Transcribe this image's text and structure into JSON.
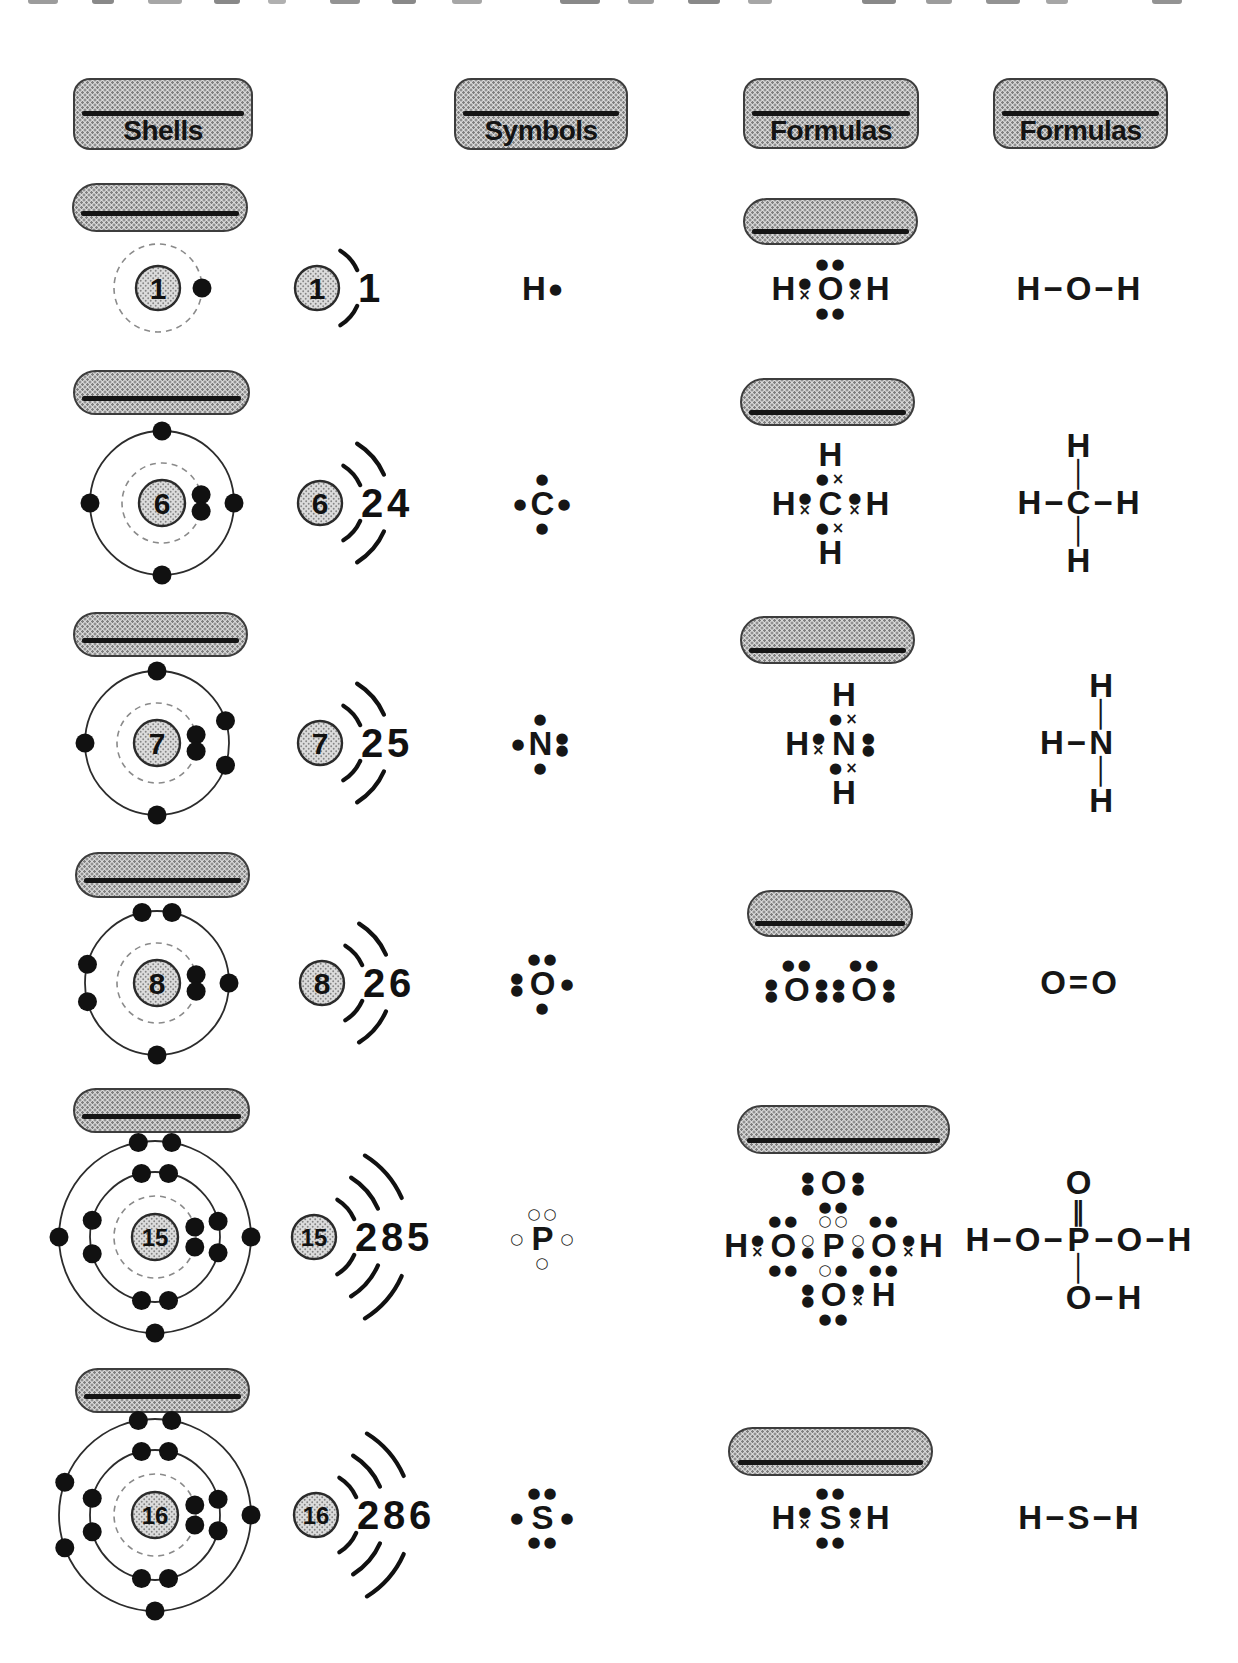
{
  "headers": [
    "Shells",
    "Symbols",
    "Formulas",
    "Formulas"
  ],
  "rows": [
    {
      "element": "hydrogen",
      "compound": "water",
      "nucleus": "1",
      "shell_counts": [
        "1"
      ],
      "bohr_shells": [
        {
          "dashed": true,
          "electrons": [
            0
          ]
        }
      ],
      "symbol": [
        [
          "H",
          "●"
        ]
      ],
      "lewis": [
        [
          "",
          "",
          "h:●●",
          "",
          ""
        ],
        [
          "H",
          "v:●×",
          "O",
          "v:●×",
          "H"
        ],
        [
          "",
          "",
          "h:●●",
          "",
          ""
        ]
      ],
      "structural": [
        [
          "H",
          "−",
          "O",
          "−",
          "H"
        ]
      ]
    },
    {
      "element": "carbon",
      "compound": "methane",
      "nucleus": "6",
      "shell_counts": [
        "2",
        "4"
      ],
      "bohr_shells": [
        {
          "dashed": true,
          "electrons": [
            12,
            -12
          ]
        },
        {
          "dashed": false,
          "electrons": [
            90,
            180,
            270,
            0
          ]
        }
      ],
      "symbol": [
        [
          "",
          "●",
          ""
        ],
        [
          "●",
          "C",
          "●"
        ],
        [
          "",
          "●",
          ""
        ]
      ],
      "lewis": [
        [
          "",
          "",
          "H",
          "",
          ""
        ],
        [
          "",
          "",
          "h:●×",
          "",
          ""
        ],
        [
          "H",
          "v:●×",
          "C",
          "v:●×",
          "H"
        ],
        [
          "",
          "",
          "h:●×",
          "",
          ""
        ],
        [
          "",
          "",
          "H",
          "",
          ""
        ]
      ],
      "structural": [
        [
          "",
          "",
          "H",
          "",
          ""
        ],
        [
          "",
          "",
          "│",
          "",
          ""
        ],
        [
          "H",
          "−",
          "C",
          "−",
          "H"
        ],
        [
          "",
          "",
          "│",
          "",
          ""
        ],
        [
          "",
          "",
          "H",
          "",
          ""
        ]
      ]
    },
    {
      "element": "nitrogen",
      "compound": "ammonia",
      "nucleus": "7",
      "shell_counts": [
        "2",
        "5"
      ],
      "bohr_shells": [
        {
          "dashed": true,
          "electrons": [
            12,
            -12
          ]
        },
        {
          "dashed": false,
          "electrons": [
            90,
            180,
            270,
            18,
            -18
          ]
        }
      ],
      "symbol": [
        [
          "",
          "●",
          ""
        ],
        [
          "●",
          "N",
          "v:●●"
        ],
        [
          "",
          "●",
          ""
        ]
      ],
      "lewis": [
        [
          "",
          "",
          "H",
          ""
        ],
        [
          "",
          "",
          "h:●×",
          ""
        ],
        [
          "H",
          "v:●×",
          "N",
          "v:●●"
        ],
        [
          "",
          "",
          "h:●×",
          ""
        ],
        [
          "",
          "",
          "H",
          ""
        ]
      ],
      "structural": [
        [
          "",
          "",
          "H",
          ""
        ],
        [
          "",
          "",
          "│",
          ""
        ],
        [
          "H",
          "−",
          "N",
          ""
        ],
        [
          "",
          "",
          "│",
          ""
        ],
        [
          "",
          "",
          "H",
          ""
        ]
      ]
    },
    {
      "element": "oxygen",
      "compound": "oxygen-molecule",
      "nucleus": "8",
      "shell_counts": [
        "2",
        "6"
      ],
      "bohr_shells": [
        {
          "dashed": true,
          "electrons": [
            12,
            -12
          ]
        },
        {
          "dashed": false,
          "electrons": [
            102,
            78,
            165,
            195,
            0,
            270
          ]
        }
      ],
      "symbol": [
        [
          "",
          "h:●●",
          ""
        ],
        [
          "v:●●",
          "O",
          "●"
        ],
        [
          "",
          "●",
          ""
        ]
      ],
      "lewis": [
        [
          "",
          "h:●●",
          "",
          "",
          "h:●●",
          ""
        ],
        [
          "v:●●",
          "O",
          "v:●●",
          "v:●●",
          "O",
          "v:●●"
        ]
      ],
      "structural": [
        [
          "O",
          "=",
          "O"
        ]
      ]
    },
    {
      "element": "phosphorus",
      "compound": "phosphoric-acid",
      "nucleus": "15",
      "shell_counts": [
        "2",
        "8",
        "5"
      ],
      "bohr_shells": [
        {
          "dashed": true,
          "electrons": [
            14,
            -14
          ]
        },
        {
          "dashed": false,
          "electrons": [
            102,
            78,
            165,
            195,
            258,
            282,
            14,
            -14
          ]
        },
        {
          "dashed": false,
          "electrons": [
            100,
            80,
            180,
            0,
            270
          ]
        }
      ],
      "symbol": [
        [
          "",
          "h:○○",
          ""
        ],
        [
          "○",
          "P",
          "○"
        ],
        [
          "",
          "○",
          ""
        ]
      ],
      "lewis": [
        [
          "",
          "",
          "",
          "v:●●",
          "O",
          "v:●●",
          "",
          "",
          ""
        ],
        [
          "",
          "",
          "",
          "",
          "h:●●",
          "",
          "",
          "",
          ""
        ],
        [
          "",
          "",
          "h:●●",
          "",
          "h:○○",
          "",
          "h:●●",
          "",
          ""
        ],
        [
          "H",
          "v:●×",
          "O",
          "v:○●",
          "P",
          "v:○●",
          "O",
          "v:●×",
          "H"
        ],
        [
          "",
          "",
          "h:●●",
          "",
          "h:○●",
          "",
          "h:●●",
          "",
          ""
        ],
        [
          "",
          "",
          "",
          "v:●●",
          "O",
          "v:●×",
          "H",
          "",
          ""
        ],
        [
          "",
          "",
          "",
          "",
          "h:●●",
          "",
          "",
          "",
          ""
        ]
      ],
      "structural": [
        [
          "",
          "",
          "",
          "",
          "O",
          "",
          "",
          "",
          ""
        ],
        [
          "",
          "",
          "",
          "",
          "‖",
          "",
          "",
          "",
          ""
        ],
        [
          "H",
          "−",
          "O",
          "−",
          "P",
          "−",
          "O",
          "−",
          "H"
        ],
        [
          "",
          "",
          "",
          "",
          "│",
          "",
          "",
          "",
          ""
        ],
        [
          "",
          "",
          "",
          "",
          "O",
          "−",
          "H",
          "",
          ""
        ]
      ]
    },
    {
      "element": "sulfur",
      "compound": "hydrogen-sulfide",
      "nucleus": "16",
      "shell_counts": [
        "2",
        "8",
        "6"
      ],
      "bohr_shells": [
        {
          "dashed": true,
          "electrons": [
            14,
            -14
          ]
        },
        {
          "dashed": false,
          "electrons": [
            102,
            78,
            165,
            195,
            258,
            282,
            14,
            -14
          ]
        },
        {
          "dashed": false,
          "electrons": [
            100,
            80,
            160,
            200,
            0,
            270
          ]
        }
      ],
      "symbol": [
        [
          "",
          "h:●●",
          ""
        ],
        [
          "●",
          "S",
          "●"
        ],
        [
          "",
          "h:●●",
          ""
        ]
      ],
      "lewis": [
        [
          "",
          "",
          "h:●●",
          "",
          ""
        ],
        [
          "H",
          "v:●×",
          "S",
          "v:●×",
          "H"
        ],
        [
          "",
          "",
          "h:●●",
          "",
          ""
        ]
      ],
      "structural": [
        [
          "H",
          "−",
          "S",
          "−",
          "H"
        ]
      ]
    }
  ]
}
